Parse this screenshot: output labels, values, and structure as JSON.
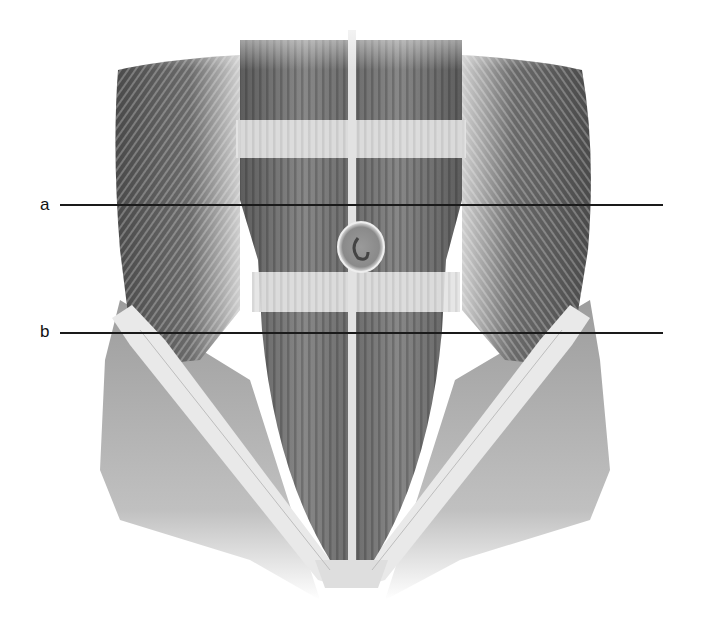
{
  "diagram": {
    "type": "anatomical-illustration",
    "structures": [
      {
        "name": "rectus-abdominis",
        "description": "paired vertical muscle bands either side of midline"
      },
      {
        "name": "linea-alba",
        "description": "white vertical midline"
      },
      {
        "name": "tendinous-intersections",
        "description": "horizontal light bands across rectus abdominis"
      },
      {
        "name": "umbilicus",
        "description": "circular navel at midline"
      },
      {
        "name": "external-oblique",
        "description": "lateral hatched muscles on each side"
      },
      {
        "name": "inguinal-aponeurosis",
        "description": "light V-shaped band converging to pubis"
      }
    ],
    "labels": [
      {
        "id": "a",
        "text": "a",
        "y": 205
      },
      {
        "id": "b",
        "text": "b",
        "y": 333
      }
    ],
    "colors": {
      "background": "#ffffff",
      "muscle_dark": "#5a5a5a",
      "muscle_mid": "#8a8a8a",
      "tendon_light": "#e6e6e6",
      "leader_line": "#1a1a1a"
    }
  }
}
